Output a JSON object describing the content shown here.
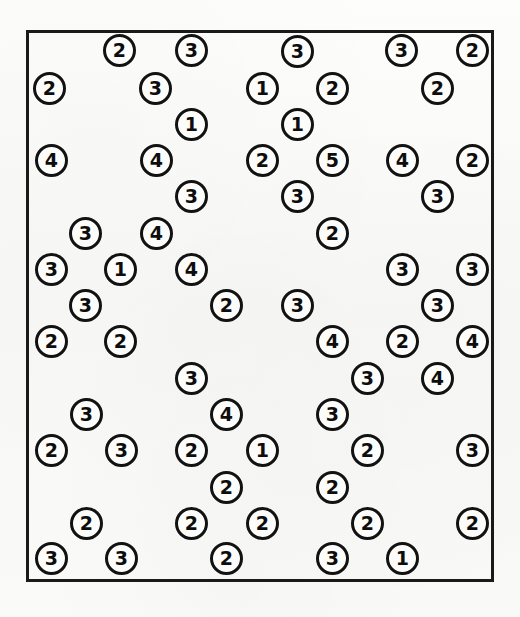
{
  "scene": {
    "title": "Numbered Token Scatter",
    "canvas_width": 520,
    "canvas_height": 617,
    "background_color": "#fbfbf9",
    "ink_color": "#121212"
  },
  "enclosure": {
    "name": "bounding-rectangle",
    "x": 26,
    "y": 30,
    "width": 468,
    "height": 552,
    "stroke_color": "#1a1a1a",
    "stroke_width": 3
  },
  "token_style": {
    "diameter": 33,
    "stroke_width": 3,
    "font_size": 19
  },
  "tokens": [
    {
      "value": "2",
      "cx": 119,
      "cy": 50
    },
    {
      "value": "3",
      "cx": 191,
      "cy": 50
    },
    {
      "value": "3",
      "cx": 297,
      "cy": 51
    },
    {
      "value": "3",
      "cx": 401,
      "cy": 50
    },
    {
      "value": "2",
      "cx": 472,
      "cy": 50
    },
    {
      "value": "2",
      "cx": 49,
      "cy": 88
    },
    {
      "value": "3",
      "cx": 155,
      "cy": 88
    },
    {
      "value": "1",
      "cx": 262,
      "cy": 88
    },
    {
      "value": "2",
      "cx": 332,
      "cy": 88
    },
    {
      "value": "2",
      "cx": 437,
      "cy": 88
    },
    {
      "value": "1",
      "cx": 191,
      "cy": 124
    },
    {
      "value": "1",
      "cx": 297,
      "cy": 124
    },
    {
      "value": "4",
      "cx": 51,
      "cy": 160
    },
    {
      "value": "4",
      "cx": 156,
      "cy": 160
    },
    {
      "value": "2",
      "cx": 262,
      "cy": 160
    },
    {
      "value": "5",
      "cx": 332,
      "cy": 160
    },
    {
      "value": "4",
      "cx": 402,
      "cy": 160
    },
    {
      "value": "2",
      "cx": 472,
      "cy": 160
    },
    {
      "value": "3",
      "cx": 191,
      "cy": 196
    },
    {
      "value": "3",
      "cx": 297,
      "cy": 196
    },
    {
      "value": "3",
      "cx": 437,
      "cy": 196
    },
    {
      "value": "3",
      "cx": 85,
      "cy": 233
    },
    {
      "value": "4",
      "cx": 156,
      "cy": 233
    },
    {
      "value": "2",
      "cx": 332,
      "cy": 233
    },
    {
      "value": "3",
      "cx": 51,
      "cy": 269
    },
    {
      "value": "1",
      "cx": 120,
      "cy": 269
    },
    {
      "value": "4",
      "cx": 191,
      "cy": 269
    },
    {
      "value": "3",
      "cx": 402,
      "cy": 269
    },
    {
      "value": "3",
      "cx": 472,
      "cy": 269
    },
    {
      "value": "3",
      "cx": 85,
      "cy": 305
    },
    {
      "value": "2",
      "cx": 226,
      "cy": 305
    },
    {
      "value": "3",
      "cx": 297,
      "cy": 305
    },
    {
      "value": "3",
      "cx": 437,
      "cy": 305
    },
    {
      "value": "2",
      "cx": 51,
      "cy": 341
    },
    {
      "value": "2",
      "cx": 120,
      "cy": 341
    },
    {
      "value": "4",
      "cx": 332,
      "cy": 341
    },
    {
      "value": "2",
      "cx": 402,
      "cy": 341
    },
    {
      "value": "4",
      "cx": 472,
      "cy": 341
    },
    {
      "value": "3",
      "cx": 191,
      "cy": 378
    },
    {
      "value": "3",
      "cx": 367,
      "cy": 378
    },
    {
      "value": "4",
      "cx": 437,
      "cy": 378
    },
    {
      "value": "3",
      "cx": 86,
      "cy": 414
    },
    {
      "value": "4",
      "cx": 226,
      "cy": 414
    },
    {
      "value": "3",
      "cx": 332,
      "cy": 414
    },
    {
      "value": "2",
      "cx": 51,
      "cy": 450
    },
    {
      "value": "3",
      "cx": 121,
      "cy": 450
    },
    {
      "value": "2",
      "cx": 191,
      "cy": 450
    },
    {
      "value": "1",
      "cx": 262,
      "cy": 450
    },
    {
      "value": "2",
      "cx": 367,
      "cy": 450
    },
    {
      "value": "3",
      "cx": 472,
      "cy": 450
    },
    {
      "value": "2",
      "cx": 226,
      "cy": 487
    },
    {
      "value": "2",
      "cx": 332,
      "cy": 487
    },
    {
      "value": "2",
      "cx": 86,
      "cy": 523
    },
    {
      "value": "2",
      "cx": 191,
      "cy": 523
    },
    {
      "value": "2",
      "cx": 262,
      "cy": 523
    },
    {
      "value": "2",
      "cx": 367,
      "cy": 523
    },
    {
      "value": "2",
      "cx": 472,
      "cy": 523
    },
    {
      "value": "3",
      "cx": 51,
      "cy": 558
    },
    {
      "value": "3",
      "cx": 121,
      "cy": 558
    },
    {
      "value": "2",
      "cx": 226,
      "cy": 558
    },
    {
      "value": "3",
      "cx": 332,
      "cy": 558
    },
    {
      "value": "1",
      "cx": 402,
      "cy": 558
    }
  ]
}
